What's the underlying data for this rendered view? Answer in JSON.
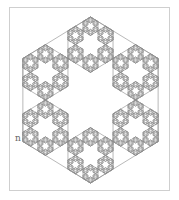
{
  "figure": {
    "title": "",
    "type": "hexaflake",
    "label": "n",
    "line_color": "#8a8a8a",
    "frame_color": "#cfcfcf",
    "background": "#ffffff",
    "center": [
      90.5,
      100
    ],
    "radius": 83,
    "x_scale": 0.815,
    "depth": 4,
    "draw_center": false,
    "draw_outlines_levels": [
      0,
      1,
      2,
      3,
      4
    ]
  }
}
